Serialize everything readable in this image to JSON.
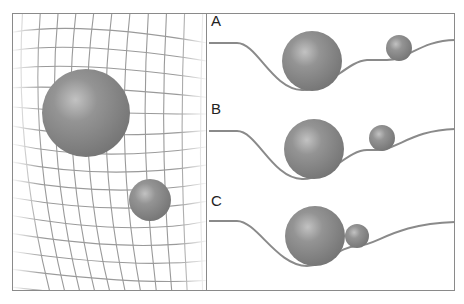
{
  "diagram": {
    "colors": {
      "frame": "#8a8a8a",
      "grid": "#9a9a9a",
      "sphere": "#8c8c8c",
      "curve": "#8a8a8a"
    },
    "panels": [
      {
        "label": "A"
      },
      {
        "label": "B"
      },
      {
        "label": "C"
      }
    ]
  }
}
